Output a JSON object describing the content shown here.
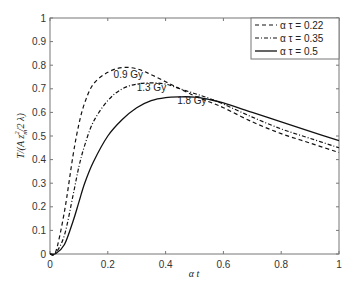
{
  "chart_data": {
    "type": "line",
    "title": "",
    "xlabel": "α t",
    "ylabel": "T/(A z_m^2 / 2 λ)",
    "xlim": [
      0,
      1
    ],
    "ylim": [
      0,
      1
    ],
    "xticks": [
      "0",
      "0.2",
      "0.4",
      "0.6",
      "0.8",
      "1"
    ],
    "yticks": [
      "0",
      "0.1",
      "0.2",
      "0.3",
      "0.4",
      "0.5",
      "0.6",
      "0.7",
      "0.8",
      "0.9",
      "1"
    ],
    "grid": false,
    "legend_position": "upper right",
    "x": [
      0,
      0.02,
      0.05,
      0.08,
      0.1,
      0.12,
      0.15,
      0.2,
      0.25,
      0.3,
      0.35,
      0.4,
      0.45,
      0.5,
      0.55,
      0.6,
      0.7,
      0.8,
      0.9,
      1.0
    ],
    "series": [
      {
        "name": "α τ = 0.22",
        "style": "dashed",
        "values": [
          0,
          0.01,
          0.18,
          0.42,
          0.55,
          0.64,
          0.72,
          0.77,
          0.79,
          0.785,
          0.76,
          0.73,
          0.7,
          0.67,
          0.645,
          0.62,
          0.56,
          0.51,
          0.47,
          0.43
        ]
      },
      {
        "name": "α τ = 0.35",
        "style": "dash-dot",
        "values": [
          0,
          0.005,
          0.08,
          0.25,
          0.37,
          0.46,
          0.56,
          0.65,
          0.7,
          0.72,
          0.725,
          0.72,
          0.7,
          0.68,
          0.66,
          0.635,
          0.58,
          0.53,
          0.49,
          0.45
        ]
      },
      {
        "name": "α τ = 0.5",
        "style": "solid",
        "values": [
          0,
          0.002,
          0.04,
          0.14,
          0.22,
          0.3,
          0.39,
          0.5,
          0.57,
          0.62,
          0.65,
          0.663,
          0.666,
          0.665,
          0.655,
          0.64,
          0.6,
          0.56,
          0.52,
          0.48
        ]
      }
    ],
    "annotations": [
      {
        "text": "0.9 Gy",
        "x": 0.22,
        "y": 0.745
      },
      {
        "text": "1.3 Gy",
        "x": 0.3,
        "y": 0.69
      },
      {
        "text": "1.8 Gy",
        "x": 0.44,
        "y": 0.635
      }
    ]
  },
  "legend": {
    "items": [
      {
        "label": "α τ = 0.22"
      },
      {
        "label": "α τ = 0.35"
      },
      {
        "label": "α τ = 0.5"
      }
    ]
  },
  "axes": {
    "xlabel": "α t",
    "ylabel_main": "T/(A z",
    "ylabel_sub": "m",
    "ylabel_sup": "2",
    "ylabel_tail": "/2 λ)"
  }
}
